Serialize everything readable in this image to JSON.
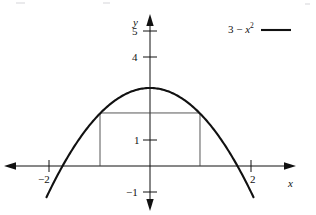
{
  "figure": {
    "background_color": "#ffffff",
    "ink_color": "#111111",
    "curve_color": "#111111",
    "rectangle_color": "#444444",
    "width": 316,
    "height": 215
  },
  "axes": {
    "x_axis_label": "x",
    "y_axis_label": "y",
    "origin_px": {
      "x": 150,
      "y": 166
    },
    "x_scale_px_per_unit": 50.5,
    "y_scale_px_per_unit": 26
  },
  "legend": {
    "entries": [
      {
        "label_prefix": "3 − ",
        "label_var": "x",
        "label_exponent": "2",
        "full_label": "3 − x²",
        "sample_style": "solid-line"
      }
    ]
  },
  "chart_data": {
    "type": "line",
    "title": "",
    "subtitle": "",
    "xlabel": "x",
    "ylabel": "y",
    "xlim": [
      -2.2,
      2.35
    ],
    "ylim": [
      -1.45,
      5.5
    ],
    "grid": false,
    "legend_position": "top-right",
    "x_ticks": [
      -2,
      2
    ],
    "x_tick_labels": [
      "−2",
      "2"
    ],
    "y_ticks": [
      5,
      4,
      1,
      -1
    ],
    "y_tick_labels": [
      "5",
      "4",
      "1",
      "−1"
    ],
    "series": [
      {
        "name": "3 − x²",
        "type": "line",
        "equation": "y = 3 - x^2",
        "color": "#111111",
        "x_domain": [
          -2.05,
          2.05
        ],
        "vertex": [
          0,
          3
        ],
        "roots": [
          -1.732,
          1.732
        ],
        "x": [
          -2.05,
          -1.8,
          -1.6,
          -1.4,
          -1.2,
          -1.0,
          -0.8,
          -0.6,
          -0.4,
          -0.2,
          0,
          0.2,
          0.4,
          0.6,
          0.8,
          1.0,
          1.2,
          1.4,
          1.6,
          1.8,
          2.05
        ],
        "y": [
          -1.2,
          -0.24,
          0.44,
          1.04,
          1.56,
          2.0,
          2.36,
          2.64,
          2.84,
          2.96,
          3.0,
          2.96,
          2.84,
          2.64,
          2.36,
          2.0,
          1.56,
          1.04,
          0.44,
          -0.24,
          -1.2
        ]
      }
    ],
    "annotations": [
      {
        "name": "inscribed-rectangle",
        "type": "rectangle",
        "x_left": -0.99,
        "x_right": 0.99,
        "y_bottom": 0,
        "y_top": 2.04,
        "width": 1.98,
        "height": 2.04,
        "color": "#444444"
      }
    ]
  }
}
